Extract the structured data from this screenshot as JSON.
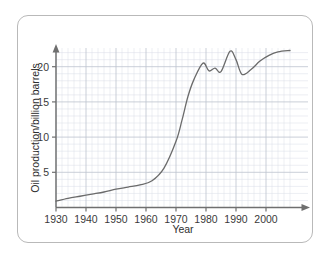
{
  "figure": {
    "border_color": "#b9b9b9",
    "background": "#ffffff"
  },
  "chart_data": {
    "type": "line",
    "title": "",
    "xlabel": "Year",
    "ylabel": "Oil production/billion barrels",
    "xlim": [
      1930,
      2009
    ],
    "ylim": [
      0,
      24
    ],
    "xticks": [
      1930,
      1940,
      1950,
      1960,
      1970,
      1980,
      1990,
      2000
    ],
    "xtick_labels": [
      "1930",
      "1940",
      "1950",
      "1960",
      "1970",
      "1980",
      "1990",
      "2000"
    ],
    "yticks": [
      5,
      10,
      15,
      20
    ],
    "ytick_labels": [
      "5",
      "10",
      "15",
      "20"
    ],
    "grid": true,
    "grid_minor_step_x": 2,
    "grid_major_step_x": 10,
    "grid_color": "#d8dde6",
    "grid_major_color": "#bcc3ce",
    "line_color": "#6b6b6b",
    "line_width": 1.3,
    "legend": null,
    "axis_arrows": true,
    "series": [
      {
        "name": "World oil production",
        "x": [
          1930,
          1934,
          1938,
          1942,
          1946,
          1950,
          1954,
          1958,
          1962,
          1966,
          1970,
          1972,
          1974,
          1976,
          1979,
          1981,
          1983,
          1985,
          1988,
          1990,
          1992,
          1995,
          1998,
          2001,
          2004,
          2008
        ],
        "values": [
          0.9,
          1.3,
          1.6,
          1.9,
          2.2,
          2.6,
          2.9,
          3.2,
          3.8,
          5.6,
          9.4,
          12.4,
          15.8,
          18.2,
          20.5,
          19.4,
          19.8,
          19.3,
          22.2,
          21.0,
          18.9,
          19.6,
          20.8,
          21.6,
          22.1,
          22.3
        ]
      }
    ]
  }
}
